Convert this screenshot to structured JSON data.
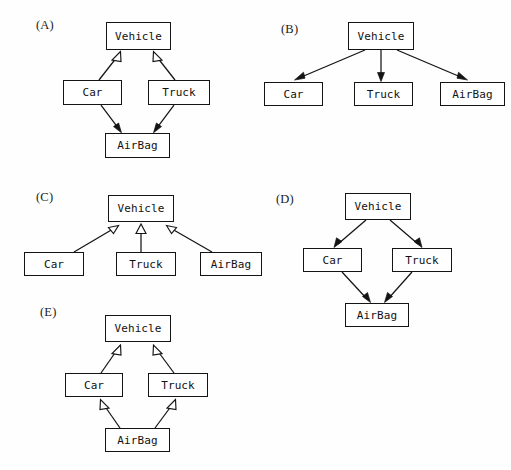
{
  "figure": {
    "background_color": "#fefefe",
    "line_color": "#141414",
    "box_fill": "#ffffff",
    "panels": [
      {
        "tag": "(A)",
        "tag_pos": [
          36,
          18
        ],
        "nodes": [
          {
            "name": "vehicle",
            "label": "Vehicle",
            "x": 106,
            "y": 22,
            "w": 65,
            "h": 28
          },
          {
            "name": "car",
            "label": "Car",
            "x": 63,
            "y": 80,
            "w": 59,
            "h": 25
          },
          {
            "name": "truck",
            "label": "Truck",
            "x": 148,
            "y": 80,
            "w": 62,
            "h": 25
          },
          {
            "name": "airbag",
            "label": "AirBag",
            "x": 105,
            "y": 133,
            "w": 65,
            "h": 25
          }
        ],
        "edges": [
          {
            "from": "car",
            "to": "vehicle",
            "head": "hollow-triangle",
            "direction": "up"
          },
          {
            "from": "truck",
            "to": "vehicle",
            "head": "hollow-triangle",
            "direction": "up"
          },
          {
            "from": "car",
            "to": "airbag",
            "head": "solid-barb",
            "direction": "down"
          },
          {
            "from": "truck",
            "to": "airbag",
            "head": "solid-barb",
            "direction": "down"
          }
        ]
      },
      {
        "tag": "(B)",
        "tag_pos": [
          281,
          22
        ],
        "nodes": [
          {
            "name": "vehicle",
            "label": "Vehicle",
            "x": 348,
            "y": 22,
            "w": 66,
            "h": 28
          },
          {
            "name": "car",
            "label": "Car",
            "x": 264,
            "y": 82,
            "w": 59,
            "h": 24
          },
          {
            "name": "truck",
            "label": "Truck",
            "x": 354,
            "y": 82,
            "w": 59,
            "h": 24
          },
          {
            "name": "airbag",
            "label": "AirBag",
            "x": 440,
            "y": 82,
            "w": 65,
            "h": 24
          }
        ],
        "edges": [
          {
            "from": "vehicle",
            "to": "car",
            "head": "solid-barb",
            "direction": "down"
          },
          {
            "from": "vehicle",
            "to": "truck",
            "head": "solid-barb",
            "direction": "down"
          },
          {
            "from": "vehicle",
            "to": "airbag",
            "head": "solid-barb",
            "direction": "down"
          }
        ]
      },
      {
        "tag": "(C)",
        "tag_pos": [
          36,
          190
        ],
        "nodes": [
          {
            "name": "vehicle",
            "label": "Vehicle",
            "x": 108,
            "y": 195,
            "w": 66,
            "h": 27
          },
          {
            "name": "car",
            "label": "Car",
            "x": 24,
            "y": 252,
            "w": 60,
            "h": 24
          },
          {
            "name": "truck",
            "label": "Truck",
            "x": 116,
            "y": 252,
            "w": 60,
            "h": 24
          },
          {
            "name": "airbag",
            "label": "AirBag",
            "x": 200,
            "y": 252,
            "w": 62,
            "h": 24
          }
        ],
        "edges": [
          {
            "from": "car",
            "to": "vehicle",
            "head": "hollow-triangle",
            "direction": "up"
          },
          {
            "from": "truck",
            "to": "vehicle",
            "head": "hollow-triangle",
            "direction": "up"
          },
          {
            "from": "airbag",
            "to": "vehicle",
            "head": "hollow-triangle",
            "direction": "up"
          }
        ]
      },
      {
        "tag": "(D)",
        "tag_pos": [
          276,
          192
        ],
        "nodes": [
          {
            "name": "vehicle",
            "label": "Vehicle",
            "x": 345,
            "y": 193,
            "w": 66,
            "h": 27
          },
          {
            "name": "car",
            "label": "Car",
            "x": 303,
            "y": 248,
            "w": 59,
            "h": 24
          },
          {
            "name": "truck",
            "label": "Truck",
            "x": 392,
            "y": 248,
            "w": 60,
            "h": 24
          },
          {
            "name": "airbag",
            "label": "AirBag",
            "x": 345,
            "y": 303,
            "w": 64,
            "h": 24
          }
        ],
        "edges": [
          {
            "from": "vehicle",
            "to": "car",
            "head": "solid-barb",
            "direction": "down"
          },
          {
            "from": "vehicle",
            "to": "truck",
            "head": "solid-barb",
            "direction": "down"
          },
          {
            "from": "car",
            "to": "airbag",
            "head": "solid-barb",
            "direction": "down"
          },
          {
            "from": "truck",
            "to": "airbag",
            "head": "solid-barb",
            "direction": "down"
          }
        ]
      },
      {
        "tag": "(E)",
        "tag_pos": [
          40,
          305
        ],
        "nodes": [
          {
            "name": "vehicle",
            "label": "Vehicle",
            "x": 105,
            "y": 315,
            "w": 66,
            "h": 27
          },
          {
            "name": "car",
            "label": "Car",
            "x": 65,
            "y": 373,
            "w": 58,
            "h": 24
          },
          {
            "name": "truck",
            "label": "Truck",
            "x": 148,
            "y": 373,
            "w": 60,
            "h": 24
          },
          {
            "name": "airbag",
            "label": "AirBag",
            "x": 105,
            "y": 428,
            "w": 65,
            "h": 24
          }
        ],
        "edges": [
          {
            "from": "car",
            "to": "vehicle",
            "head": "hollow-triangle",
            "direction": "up"
          },
          {
            "from": "truck",
            "to": "vehicle",
            "head": "hollow-triangle",
            "direction": "up"
          },
          {
            "from": "airbag",
            "to": "car",
            "head": "hollow-triangle",
            "direction": "up"
          },
          {
            "from": "airbag",
            "to": "truck",
            "head": "hollow-triangle",
            "direction": "up"
          }
        ]
      }
    ]
  },
  "labels": {
    "a": "(A)",
    "b": "(B)",
    "c": "(C)",
    "d": "(D)",
    "e": "(E)",
    "vehicle": "Vehicle",
    "car": "Car",
    "truck": "Truck",
    "airbag": "AirBag"
  }
}
